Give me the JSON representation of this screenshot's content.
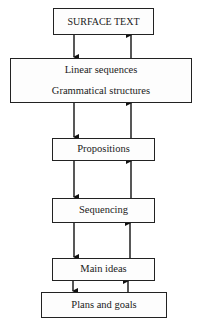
{
  "diagram": {
    "type": "layered-flow",
    "boxes": [
      {
        "id": "surface-text",
        "lines": [
          "SURFACE TEXT"
        ]
      },
      {
        "id": "linear-grammatical",
        "lines": [
          "Linear sequences",
          "Grammatical structures"
        ]
      },
      {
        "id": "propositions",
        "lines": [
          "Propositions"
        ]
      },
      {
        "id": "sequencing",
        "lines": [
          "Sequencing"
        ]
      },
      {
        "id": "main-ideas",
        "lines": [
          "Main ideas"
        ]
      },
      {
        "id": "plans-goals",
        "lines": [
          "Plans and goals"
        ]
      }
    ],
    "connections": [
      {
        "from": "surface-text",
        "to": "linear-grammatical",
        "direction": "down"
      },
      {
        "from": "linear-grammatical",
        "to": "surface-text",
        "direction": "up"
      },
      {
        "from": "linear-grammatical",
        "to": "propositions",
        "direction": "down"
      },
      {
        "from": "propositions",
        "to": "linear-grammatical",
        "direction": "up"
      },
      {
        "from": "propositions",
        "to": "sequencing",
        "direction": "down"
      },
      {
        "from": "sequencing",
        "to": "propositions",
        "direction": "up"
      },
      {
        "from": "sequencing",
        "to": "main-ideas",
        "direction": "down"
      },
      {
        "from": "main-ideas",
        "to": "sequencing",
        "direction": "up"
      },
      {
        "from": "main-ideas",
        "to": "plans-goals",
        "direction": "down"
      },
      {
        "from": "plans-goals",
        "to": "main-ideas",
        "direction": "up"
      }
    ]
  }
}
